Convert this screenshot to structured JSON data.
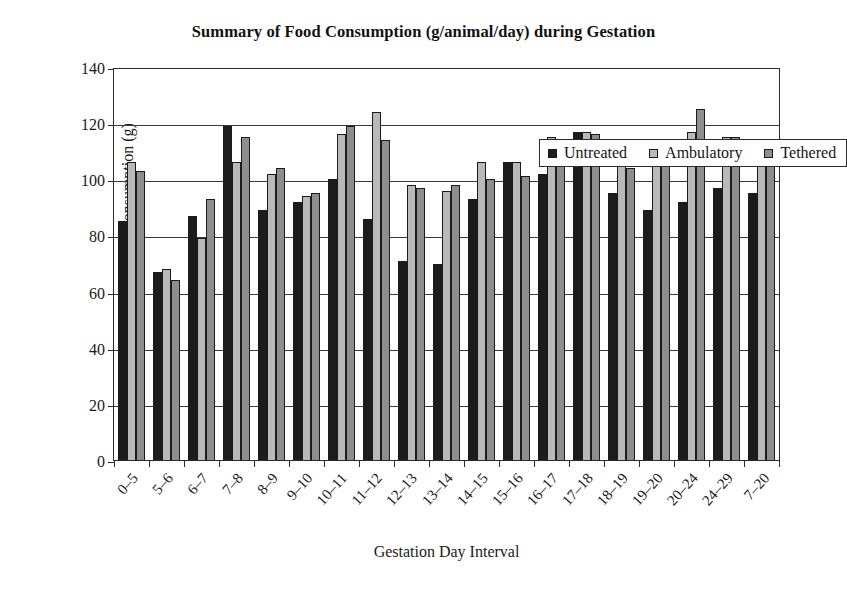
{
  "chart_data": {
    "type": "bar",
    "title": "Summary of Food Consumption (g/animal/day) during Gestation",
    "xlabel": "Gestation Day Interval",
    "ylabel": "Food Consumption (g)",
    "ylim": [
      0,
      140
    ],
    "ytick_step": 20,
    "yticks": [
      140,
      120,
      100,
      80,
      60,
      40,
      20,
      0
    ],
    "grid": "horizontal",
    "legend_position": "top-right-inside",
    "categories": [
      "0–5",
      "5–6",
      "6–7",
      "7–8",
      "8–9",
      "9–10",
      "10–11",
      "11–12",
      "12–13",
      "13–14",
      "14–15",
      "15–16",
      "16–17",
      "17–18",
      "18–19",
      "19–20",
      "20–24",
      "24–29",
      "7–20"
    ],
    "series": [
      {
        "name": "Untreated",
        "color": "#1c1c1c",
        "values": [
          85,
          67,
          87,
          119,
          89,
          92,
          100,
          86,
          71,
          70,
          93,
          106,
          102,
          117,
          95,
          89,
          92,
          97,
          95
        ]
      },
      {
        "name": "Ambulatory",
        "color": "#b9b9b9",
        "values": [
          106,
          68,
          79,
          106,
          102,
          94,
          116,
          124,
          98,
          96,
          106,
          106,
          115,
          117,
          107,
          105,
          117,
          115,
          106
        ]
      },
      {
        "name": "Tethered",
        "color": "#8e8e8e",
        "values": [
          103,
          64,
          93,
          115,
          104,
          95,
          119,
          114,
          97,
          98,
          100,
          101,
          109,
          116,
          104,
          108,
          125,
          115,
          106
        ]
      }
    ]
  }
}
